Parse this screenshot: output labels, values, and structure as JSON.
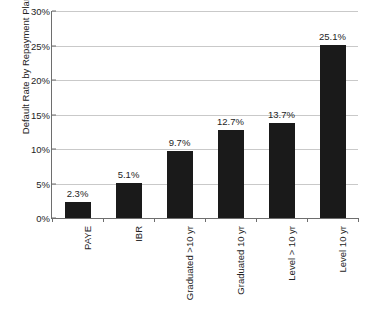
{
  "chart_data": {
    "type": "bar",
    "title": "",
    "xlabel": "",
    "ylabel": "Default Rate by Repayment Plan",
    "ylim": [
      0,
      30
    ],
    "ytick_labels": [
      "0%",
      "5%",
      "10%",
      "15%",
      "20%",
      "25%",
      "30%"
    ],
    "ytick_values": [
      0,
      5,
      10,
      15,
      20,
      25,
      30
    ],
    "grid": true,
    "legend": "none",
    "bar_color": "#1a1a1a",
    "gridline_color": "#c9c9c9",
    "axis_color": "#6e6e6e",
    "categories": [
      "PAYE",
      "IBR",
      "Graduated >10 yr",
      "Graduated 10 yr",
      "Level > 10 yr",
      "Level 10 yr"
    ],
    "values": [
      2.3,
      5.1,
      9.7,
      12.7,
      13.7,
      25.1
    ],
    "data_labels": [
      "2.3%",
      "5.1%",
      "9.7%",
      "12.7%",
      "13.7%",
      "25.1%"
    ]
  }
}
